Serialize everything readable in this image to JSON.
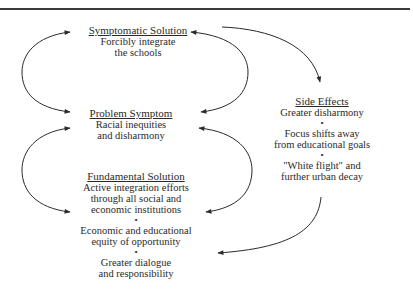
{
  "diagram": {
    "type": "systems-archetype-shifting-the-burden",
    "symptomatic_solution": {
      "title": "Symptomatic Solution",
      "lines": [
        "Forcibly integrate",
        "the schools"
      ]
    },
    "problem_symptom": {
      "title": "Problem Symptom",
      "lines": [
        "Racial inequities",
        "and disharmony"
      ]
    },
    "side_effects": {
      "title": "Side Effects",
      "items": [
        [
          "Greater disharmony"
        ],
        [
          "Focus shifts away",
          "from educational goals"
        ],
        [
          "\"White flight\" and",
          "further urban decay"
        ]
      ],
      "bullet": "•"
    },
    "fundamental_solution": {
      "title": "Fundamental Solution",
      "items": [
        [
          "Active integration efforts",
          "through all social and",
          "economic institutions"
        ],
        [
          "Economic and educational",
          "equity of opportunity"
        ],
        [
          "Greater dialogue",
          "and responsibility"
        ]
      ],
      "bullet": "•"
    },
    "arrows": [
      {
        "from": "problem_symptom",
        "to": "symptomatic_solution",
        "side": "left"
      },
      {
        "from": "symptomatic_solution",
        "to": "problem_symptom",
        "side": "right"
      },
      {
        "from": "problem_symptom",
        "to": "fundamental_solution",
        "side": "left"
      },
      {
        "from": "fundamental_solution",
        "to": "problem_symptom",
        "side": "right"
      },
      {
        "from": "symptomatic_solution",
        "to": "side_effects"
      },
      {
        "from": "side_effects",
        "to": "fundamental_solution"
      }
    ],
    "colors": {
      "ink": "#2a2a2a",
      "background": "#ffffff"
    }
  }
}
